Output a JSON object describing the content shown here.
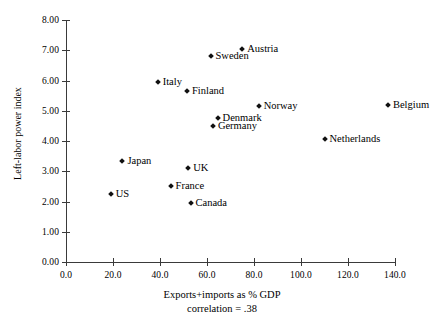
{
  "chart_data": {
    "type": "scatter",
    "title": "",
    "xlabel": "Exports+imports as % GDP",
    "ylabel": "Left-labor power index",
    "annotation": "correlation = .38",
    "xlim": [
      0,
      140
    ],
    "ylim": [
      0,
      8
    ],
    "grid": false,
    "legend": "none",
    "xticks": [
      "0.0",
      "20.0",
      "40.0",
      "60.0",
      "80.0",
      "100.0",
      "120.0",
      "140.0"
    ],
    "xtick_values": [
      0,
      20,
      40,
      60,
      80,
      100,
      120,
      140
    ],
    "yticks": [
      "0.00",
      "1.00",
      "2.00",
      "3.00",
      "4.00",
      "5.00",
      "6.00",
      "7.00",
      "8.00"
    ],
    "ytick_values": [
      0,
      1,
      2,
      3,
      4,
      5,
      6,
      7,
      8
    ],
    "marker_color": "#111111",
    "axis_color": "#3a3a3a",
    "points": [
      {
        "label": "Austria",
        "x": 75.0,
        "y": 7.05
      },
      {
        "label": "Sweden",
        "x": 61.5,
        "y": 6.8
      },
      {
        "label": "Italy",
        "x": 39.0,
        "y": 5.95
      },
      {
        "label": "Finland",
        "x": 51.5,
        "y": 5.65
      },
      {
        "label": "Norway",
        "x": 82.0,
        "y": 5.15
      },
      {
        "label": "Belgium",
        "x": 137.0,
        "y": 5.2
      },
      {
        "label": "Denmark",
        "x": 64.5,
        "y": 4.75
      },
      {
        "label": "Germany",
        "x": 62.5,
        "y": 4.5
      },
      {
        "label": "Netherlands",
        "x": 110.0,
        "y": 4.05
      },
      {
        "label": "Japan",
        "x": 24.0,
        "y": 3.35
      },
      {
        "label": "UK",
        "x": 52.0,
        "y": 3.1
      },
      {
        "label": "France",
        "x": 44.5,
        "y": 2.5
      },
      {
        "label": "US",
        "x": 19.0,
        "y": 2.25
      },
      {
        "label": "Canada",
        "x": 53.0,
        "y": 1.95
      }
    ]
  }
}
